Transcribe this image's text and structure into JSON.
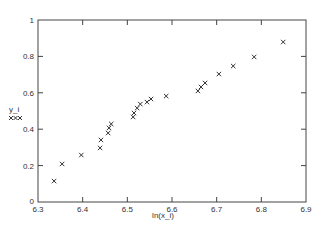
{
  "chart_data": {
    "type": "scatter",
    "title": "",
    "xlabel": "ln(x_i)",
    "ylabel": "y_i",
    "ylabel_marker": "xxx",
    "xlim": [
      6.3,
      6.9
    ],
    "ylim": [
      0,
      1
    ],
    "xticks": [
      6.3,
      6.4,
      6.5,
      6.6,
      6.7,
      6.8,
      6.9
    ],
    "xtick_labels": [
      "6.3",
      "6.4",
      "6.5",
      "6.6",
      "6.7",
      "6.8",
      "6.9"
    ],
    "yticks": [
      0,
      0.2,
      0.4,
      0.6,
      0.8,
      1
    ],
    "ytick_labels": [
      "0",
      "0.2",
      "0.4",
      "0.6",
      "0.8",
      "1"
    ],
    "grid": false,
    "legend": null,
    "marker": "x",
    "series": [
      {
        "name": "y_i",
        "x": [
          6.336,
          6.354,
          6.397,
          6.439,
          6.441,
          6.457,
          6.459,
          6.464,
          6.513,
          6.515,
          6.522,
          6.529,
          6.544,
          6.553,
          6.587,
          6.658,
          6.665,
          6.674,
          6.705,
          6.737,
          6.784,
          6.849
        ],
        "y": [
          0.115,
          0.209,
          0.258,
          0.297,
          0.341,
          0.379,
          0.407,
          0.429,
          0.467,
          0.489,
          0.516,
          0.538,
          0.549,
          0.566,
          0.582,
          0.61,
          0.632,
          0.654,
          0.703,
          0.747,
          0.797,
          0.879
        ]
      }
    ]
  }
}
